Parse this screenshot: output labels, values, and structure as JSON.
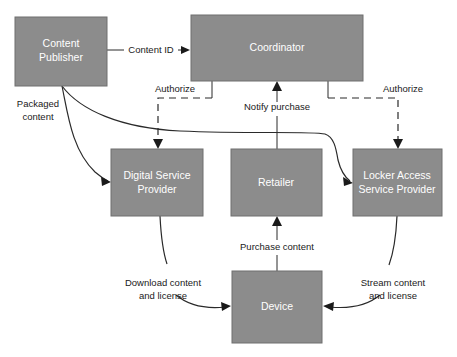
{
  "diagram": {
    "colors": {
      "node_fill": "#8c8c8c",
      "node_stroke": "#6f6f6f",
      "node_text": "#ffffff",
      "edge": "#2a2a2a",
      "label_text": "#1a1a1a",
      "background": "#ffffff"
    },
    "nodes": [
      {
        "id": "content-publisher",
        "label_line1": "Content",
        "label_line2": "Publisher",
        "x": 15,
        "y": 17,
        "width": 92,
        "height": 69
      },
      {
        "id": "coordinator",
        "label_line1": "Coordinator",
        "label_line2": "",
        "x": 191,
        "y": 15,
        "width": 172,
        "height": 66
      },
      {
        "id": "digital-service-provider",
        "label_line1": "Digital Service",
        "label_line2": "Provider",
        "x": 111,
        "y": 149,
        "width": 92,
        "height": 67
      },
      {
        "id": "retailer",
        "label_line1": "Retailer",
        "label_line2": "",
        "x": 231,
        "y": 149,
        "width": 91,
        "height": 67
      },
      {
        "id": "locker-access-service-provider",
        "label_line1": "Locker Access",
        "label_line2": "Service Provider",
        "x": 353,
        "y": 149,
        "width": 89,
        "height": 67
      },
      {
        "id": "device",
        "label_line1": "Device",
        "label_line2": "",
        "x": 232,
        "y": 271,
        "width": 90,
        "height": 72
      }
    ],
    "edges": [
      {
        "id": "content-id",
        "label": "Content ID",
        "label_line2": "",
        "from": "content-publisher",
        "to": "coordinator",
        "style": "solid"
      },
      {
        "id": "packaged-content",
        "label": "Packaged",
        "label_line2": "content",
        "from": "content-publisher",
        "to": "digital-service-provider",
        "style": "solid"
      },
      {
        "id": "packaged-content-locker",
        "label": "",
        "label_line2": "",
        "from": "content-publisher",
        "to": "locker-access-service-provider",
        "style": "solid"
      },
      {
        "id": "authorize-left",
        "label": "Authorize",
        "label_line2": "",
        "from": "coordinator",
        "to": "digital-service-provider",
        "style": "dashed"
      },
      {
        "id": "authorize-right",
        "label": "Authorize",
        "label_line2": "",
        "from": "coordinator",
        "to": "locker-access-service-provider",
        "style": "dashed"
      },
      {
        "id": "notify-purchase",
        "label": "Notify purchase",
        "label_line2": "",
        "from": "retailer",
        "to": "coordinator",
        "style": "solid"
      },
      {
        "id": "purchase-content",
        "label": "Purchase content",
        "label_line2": "",
        "from": "device",
        "to": "retailer",
        "style": "solid"
      },
      {
        "id": "download-content-and-license",
        "label": "Download content",
        "label_line2": "and license",
        "from": "digital-service-provider",
        "to": "device",
        "style": "solid"
      },
      {
        "id": "stream-content-and-license",
        "label": "Stream content",
        "label_line2": "and license",
        "from": "locker-access-service-provider",
        "to": "device",
        "style": "solid"
      }
    ]
  }
}
